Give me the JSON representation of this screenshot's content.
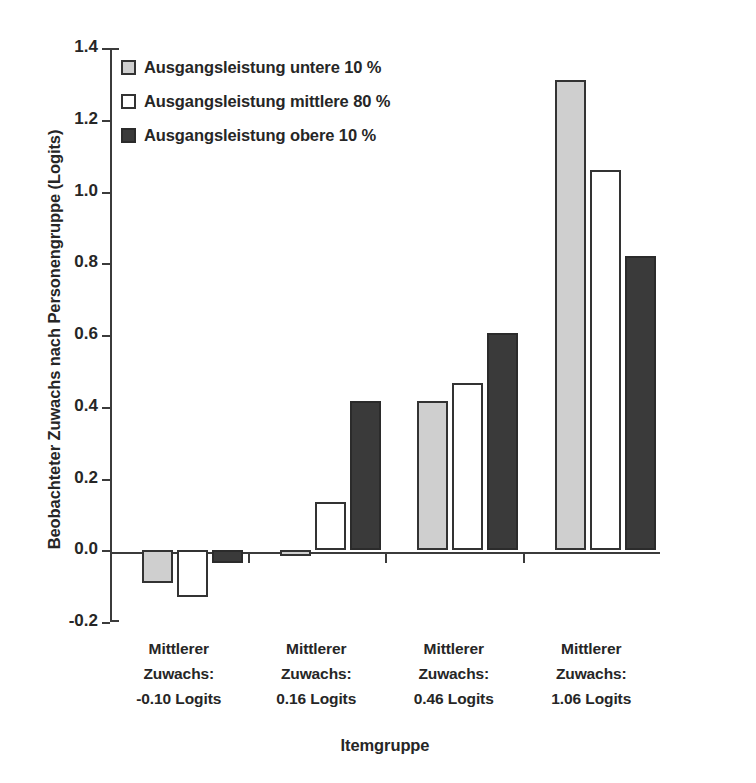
{
  "chart_data": {
    "type": "bar",
    "title": "",
    "xlabel": "Itemgruppe",
    "ylabel": "Beobachteter Zuwachs nach Personengruppe (Logits)",
    "ylim": [
      -0.2,
      1.4
    ],
    "ytick_labels": [
      "1.4",
      "1.2",
      "1.0",
      "0.8",
      "0.6",
      "0.4",
      "0.2",
      "0.0",
      "-0.2"
    ],
    "ytick_values": [
      1.4,
      1.2,
      1.0,
      0.8,
      0.6,
      0.4,
      0.2,
      0.0,
      -0.2
    ],
    "grid": false,
    "legend_position": "top-left",
    "categories": [
      "Mittlerer\nZuwachs:\n-0.10 Logits",
      "Mittlerer\nZuwachs:\n0.16 Logits",
      "Mittlerer\nZuwachs:\n0.46 Logits",
      "Mittlerer\nZuwachs:\n1.06 Logits"
    ],
    "category_lines": [
      [
        "Mittlerer",
        "Zuwachs:",
        "-0.10 Logits"
      ],
      [
        "Mittlerer",
        "Zuwachs:",
        "0.16 Logits"
      ],
      [
        "Mittlerer",
        "Zuwachs:",
        "0.46 Logits"
      ],
      [
        "Mittlerer",
        "Zuwachs:",
        "1.06 Logits"
      ]
    ],
    "series": [
      {
        "name": "Ausgangsleistung untere 10 %",
        "color": "#cfcfcf",
        "values": [
          -0.09,
          -0.015,
          0.415,
          1.31
        ]
      },
      {
        "name": "Ausgangsleistung mittlere 80 %",
        "color": "#ffffff",
        "values": [
          -0.13,
          0.135,
          0.465,
          1.06
        ]
      },
      {
        "name": "Ausgangsleistung obere 10 %",
        "color": "#3a3a3a",
        "values": [
          -0.035,
          0.415,
          0.605,
          0.82
        ]
      }
    ]
  },
  "legend": {
    "items": [
      {
        "label": "Ausgangsleistung untere 10 %",
        "swatch": "light-grey"
      },
      {
        "label": "Ausgangsleistung mittlere 80 %",
        "swatch": "white"
      },
      {
        "label": "Ausgangsleistung obere 10 %",
        "swatch": "dark-grey"
      }
    ]
  },
  "axes": {
    "y_title": "Beobachteter Zuwachs nach Personengruppe (Logits)",
    "x_title": "Itemgruppe"
  },
  "caption": {
    "text": ""
  }
}
